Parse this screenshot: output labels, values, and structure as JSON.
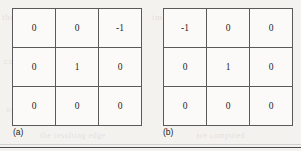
{
  "figure": {
    "panels": [
      {
        "id": "a",
        "caption": "(a)",
        "rows": [
          [
            "0",
            "0",
            "-1"
          ],
          [
            "0",
            "1",
            "0"
          ],
          [
            "0",
            "0",
            "0"
          ]
        ]
      },
      {
        "id": "b",
        "caption": "(b)",
        "rows": [
          [
            "-1",
            "0",
            "0"
          ],
          [
            "0",
            "1",
            "0"
          ],
          [
            "0",
            "0",
            "0"
          ]
        ]
      }
    ]
  },
  "background_ghost_text": {
    "line1": "the  image  and  the",
    "line2": "image  in  the  mask",
    "line3": "convolution  of  the",
    "line4": "of the mask",
    "line5": "operator  is  applied",
    "line6": "the  resulting  edge",
    "line7": "are  computed"
  },
  "colors": {
    "page_background": "#f3f2ef",
    "cell_background": "#fbfaf8",
    "grid_line": "#5a5a5a",
    "value_text": "#1d1d1d",
    "caption_text": "#222222",
    "footer_rule": "#4a4a4a"
  }
}
